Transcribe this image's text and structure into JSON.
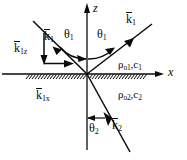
{
  "figure": {
    "title": "",
    "type": "wave-refraction-reflection-diagram",
    "colors": {
      "stroke": "#0a0a0a",
      "background": "#ffffff"
    },
    "axes": {
      "vertical_label": "z",
      "horizontal_label": "x",
      "origin_label": ""
    },
    "labels": {
      "k1_incident": {
        "symbol": "k",
        "subscript": "1",
        "overline": true
      },
      "k1_reflected": {
        "symbol": "k",
        "subscript": "1",
        "overline": true
      },
      "k1z": {
        "symbol": "k",
        "subscript": "1z",
        "overline": true
      },
      "k1x": {
        "symbol": "k",
        "subscript": "1x",
        "overline": true
      },
      "k2": {
        "symbol": "k",
        "subscript": "2",
        "overline": true
      },
      "theta1_incident": {
        "symbol": "θ",
        "subscript": "1"
      },
      "theta1_reflected": {
        "symbol": "θ",
        "subscript": "1"
      },
      "theta2": {
        "symbol": "θ",
        "subscript": "2"
      },
      "medium1": {
        "rho": "ρ",
        "rho_sub": "o1",
        "sep": ",",
        "c": "c",
        "c_sub": "1"
      },
      "medium2": {
        "rho": "ρ",
        "rho_sub": "o2",
        "sep": ",",
        "c": "c",
        "c_sub": "2"
      }
    },
    "text": {
      "z_axis": "z",
      "x_axis": "x",
      "k_base": "k",
      "k1_sub": "1",
      "k1z_sub": "1z",
      "k1x_sub": "1x",
      "k2_sub": "2",
      "theta_base": "θ",
      "theta1_sub": "1",
      "theta2_sub": "2",
      "rho_base": "ρ",
      "rho1_sub": "o1",
      "rho2_sub": "o2",
      "c_base": "c",
      "c1_sub": "1",
      "c2_sub": "2",
      "comma": ","
    },
    "geometry": {
      "origin": [
        87,
        74
      ],
      "z_axis_top": [
        87,
        4
      ],
      "z_axis_bottom": [
        87,
        150
      ],
      "x_axis_left": [
        2,
        74
      ],
      "x_axis_right": [
        164,
        74
      ],
      "incident_ray_start": [
        34,
        22
      ],
      "reflected_ray_end": [
        152,
        24
      ],
      "refracted_ray_end": [
        130,
        152
      ],
      "k1z_component": [
        44,
        36,
        44,
        63
      ],
      "k1x_component": [
        44,
        63,
        73,
        63
      ],
      "hatch_start_x": 25,
      "hatch_end_x": 146
    }
  }
}
